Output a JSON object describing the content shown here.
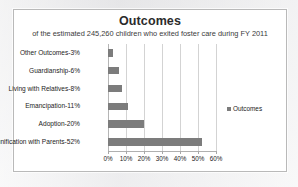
{
  "chart_data": {
    "type": "bar",
    "orientation": "horizontal",
    "title": "Outcomes",
    "subtitle": "of the estimated 245,260 children who exited  foster care during FY 2011",
    "xlabel": "",
    "ylabel": "",
    "categories": [
      "Reunification with Parents-52%",
      "Adoption-20%",
      "Emancipation-11%",
      "Living with Relatives-8%",
      "Guardianship-6%",
      "Other Outcomes-3%"
    ],
    "values": [
      52,
      20,
      11,
      8,
      6,
      3
    ],
    "series": [
      {
        "name": "Outcomes",
        "values": [
          52,
          20,
          11,
          8,
          6,
          3
        ]
      }
    ],
    "xlim": [
      0,
      60
    ],
    "xticks": [
      0,
      10,
      20,
      30,
      40,
      50,
      60
    ],
    "xticklabels": [
      "0%",
      "10%",
      "20%",
      "30%",
      "40%",
      "50%",
      "60%"
    ],
    "grid": true,
    "grid_axis": "x",
    "legend": {
      "position": "right",
      "entries": [
        "Outcomes"
      ]
    },
    "colors": {
      "bar": "#7c7c7c",
      "gridline": "#d3d3d3",
      "axis": "#b0b0b0",
      "text": "#232323",
      "title": "#2b2b2b",
      "plot_background": "#ffffff",
      "card_border": "#b9b9b9",
      "page_background": "#e9e9ea"
    }
  },
  "legend": {
    "label": "Outcomes"
  }
}
